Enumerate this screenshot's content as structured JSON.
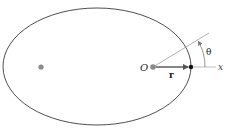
{
  "diagram": {
    "labels": {
      "origin": "O",
      "radius_vector": "r",
      "angle": "θ",
      "axis": "x"
    },
    "colors": {
      "ellipse_stroke": "#3a3a3a",
      "focus_fill": "#8a8a8a",
      "vector": "#555555",
      "axis_line": "#bdbdbd",
      "angle_line": "#9a9a9a",
      "point": "#111111",
      "text": "#222222"
    }
  }
}
